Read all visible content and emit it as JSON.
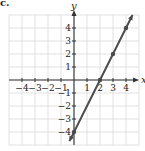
{
  "part_label": "c.",
  "chart_data": {
    "type": "line",
    "title": "",
    "xlabel": "x",
    "ylabel": "y",
    "xlim": [
      -5,
      5
    ],
    "ylim": [
      -5,
      5
    ],
    "grid": true,
    "x_ticks": [
      -4,
      -3,
      -2,
      -1,
      1,
      2,
      3,
      4
    ],
    "y_ticks": [
      -4,
      -3,
      -2,
      -1,
      1,
      2,
      3,
      4
    ],
    "x_tick_labels": [
      "−4",
      "−3",
      "−2",
      "−1",
      "1",
      "2",
      "3",
      "4"
    ],
    "y_tick_labels": [
      "−4",
      "−3",
      "−2",
      "−1",
      "1",
      "2",
      "3",
      "4"
    ],
    "series": [
      {
        "name": "y = 2x − 4",
        "line": {
          "x": [
            -0.35,
            4.5
          ],
          "y": [
            -4.7,
            5.0
          ]
        },
        "points": {
          "x": [
            0,
            2,
            3,
            4
          ],
          "y": [
            -4,
            0,
            2,
            4
          ]
        }
      }
    ],
    "colors": {
      "line": "#4a4a4a",
      "grid": "#d9d9d9",
      "axis": "#333333"
    }
  }
}
